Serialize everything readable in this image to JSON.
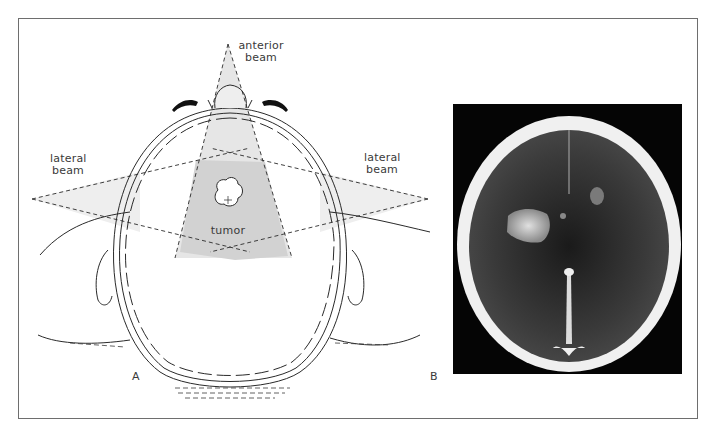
{
  "figure": {
    "panel_a": {
      "letter": "A",
      "labels": {
        "anterior_beam": [
          "anterior",
          "beam"
        ],
        "lateral_beam_left": [
          "lateral",
          "beam"
        ],
        "lateral_beam_right": [
          "lateral",
          "beam"
        ],
        "tumor": "tumor"
      },
      "colors": {
        "beam_fill": "#d9d9d9",
        "line": "#2a2a2a"
      }
    },
    "panel_b": {
      "letter": "B",
      "description": "axial CT scan of brain with bright lesion in right hemisphere",
      "colors": {
        "background": "#050505",
        "skull": "#f2f2f2",
        "brain": "#3a3a3a",
        "lesion": "#c8c8c8"
      }
    }
  }
}
